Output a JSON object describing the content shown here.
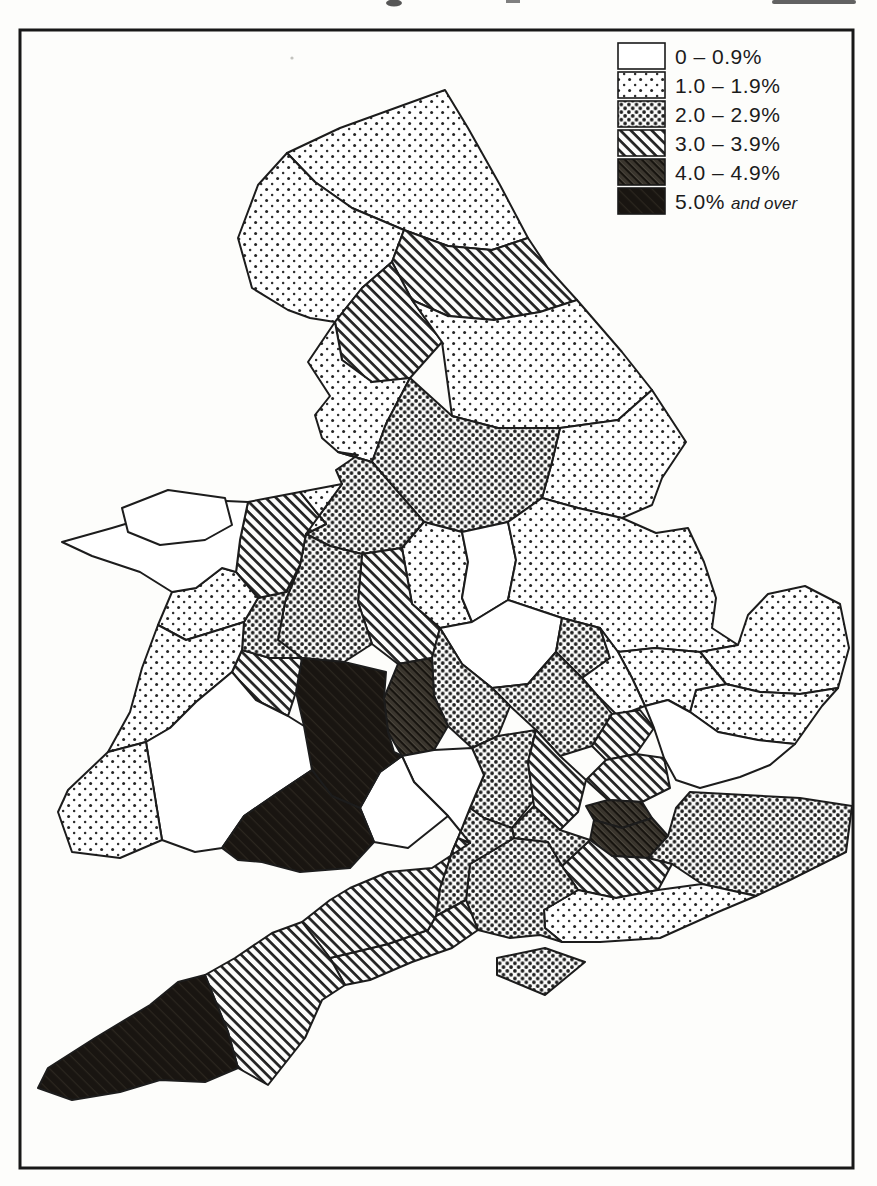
{
  "legend": {
    "categories": [
      {
        "id": "c1",
        "label": "0 – 0.9%",
        "label_suffix": "",
        "pattern": "white"
      },
      {
        "id": "c2",
        "label": "1.0 – 1.9%",
        "label_suffix": "",
        "pattern": "dots-sparse"
      },
      {
        "id": "c3",
        "label": "2.0 – 2.9%",
        "label_suffix": "",
        "pattern": "dots-dense"
      },
      {
        "id": "c4",
        "label": "3.0 – 3.9%",
        "label_suffix": "",
        "pattern": "hatch"
      },
      {
        "id": "c5",
        "label": "4.0 – 4.9%",
        "label_suffix": "",
        "pattern": "hatch-dark"
      },
      {
        "id": "c6",
        "label": "5.0%",
        "label_suffix": "and over",
        "pattern": "solid-black"
      }
    ]
  },
  "map": {
    "description": "Choropleth map of England and Wales counties shaded by percentage band",
    "regions": [
      {
        "id": "northumberland",
        "category": "c2"
      },
      {
        "id": "cumberland",
        "category": "c2"
      },
      {
        "id": "durham",
        "category": "c4"
      },
      {
        "id": "westmorland",
        "category": "c4"
      },
      {
        "id": "lancashire",
        "category": "c2"
      },
      {
        "id": "north-riding",
        "category": "c2"
      },
      {
        "id": "east-riding",
        "category": "c2"
      },
      {
        "id": "west-riding",
        "category": "c3"
      },
      {
        "id": "cheshire",
        "category": "c3"
      },
      {
        "id": "derbyshire",
        "category": "c2"
      },
      {
        "id": "nottinghamshire",
        "category": "c1"
      },
      {
        "id": "lincolnshire",
        "category": "c2"
      },
      {
        "id": "staffordshire",
        "category": "c4"
      },
      {
        "id": "shropshire",
        "category": "c3"
      },
      {
        "id": "leicestershire",
        "category": "c1"
      },
      {
        "id": "rutland",
        "category": "c3"
      },
      {
        "id": "norfolk",
        "category": "c2"
      },
      {
        "id": "suffolk",
        "category": "c2"
      },
      {
        "id": "cambridgeshire",
        "category": "c2"
      },
      {
        "id": "huntingdonshire",
        "category": "c2"
      },
      {
        "id": "northamptonshire",
        "category": "c3"
      },
      {
        "id": "warwickshire",
        "category": "c3"
      },
      {
        "id": "worcestershire",
        "category": "c5"
      },
      {
        "id": "oxfordshire",
        "category": "c3"
      },
      {
        "id": "buckinghamshire",
        "category": "c4"
      },
      {
        "id": "bedfordshire",
        "category": "c4"
      },
      {
        "id": "hertfordshire",
        "category": "c4"
      },
      {
        "id": "middlesex",
        "category": "c5"
      },
      {
        "id": "london",
        "category": "c5"
      },
      {
        "id": "essex",
        "category": "c1"
      },
      {
        "id": "kent",
        "category": "c3"
      },
      {
        "id": "surrey",
        "category": "c4"
      },
      {
        "id": "sussex",
        "category": "c2"
      },
      {
        "id": "hampshire",
        "category": "c3"
      },
      {
        "id": "berkshire",
        "category": "c3"
      },
      {
        "id": "wiltshire",
        "category": "c3"
      },
      {
        "id": "dorset",
        "category": "c4"
      },
      {
        "id": "somerset",
        "category": "c4"
      },
      {
        "id": "devon",
        "category": "c4"
      },
      {
        "id": "cornwall",
        "category": "c6"
      },
      {
        "id": "isle-of-wight",
        "category": "c3"
      },
      {
        "id": "gloucestershire",
        "category": "c1"
      },
      {
        "id": "monmouthshire",
        "category": "c1"
      },
      {
        "id": "brecknockshire",
        "category": "c6"
      },
      {
        "id": "radnorshire",
        "category": "c4"
      },
      {
        "id": "montgomeryshire",
        "category": "c3"
      },
      {
        "id": "denbighshire",
        "category": "c4"
      },
      {
        "id": "flintshire",
        "category": "c2"
      },
      {
        "id": "merioneth",
        "category": "c2"
      },
      {
        "id": "cardiganshire",
        "category": "c2"
      },
      {
        "id": "carmarthenshire",
        "category": "c1"
      },
      {
        "id": "pembrokeshire",
        "category": "c2"
      },
      {
        "id": "glamorgan",
        "category": "c6"
      },
      {
        "id": "caernarvonshire",
        "category": "c1"
      },
      {
        "id": "anglesey",
        "category": "c1"
      }
    ]
  }
}
